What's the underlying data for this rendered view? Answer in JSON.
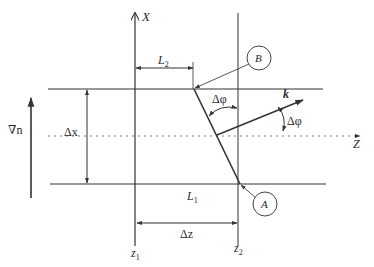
{
  "diagram": {
    "axes": {
      "x_label": "X",
      "z_label": "Z"
    },
    "planes": {
      "z1_label": "z",
      "z1_sub": "1",
      "z2_label": "z",
      "z2_sub": "2"
    },
    "dimensions": {
      "L2_label": "L",
      "L2_sub": "2",
      "L1_label": "L",
      "L1_sub": "1",
      "dz_label": "Δz",
      "dx_label": "Δx"
    },
    "gradient": {
      "label": "∇n"
    },
    "wave_vector": {
      "label": "k"
    },
    "angles": {
      "upper_label": "Δφ",
      "right_label": "Δφ"
    },
    "points": {
      "A_label": "A",
      "B_label": "B"
    },
    "colors": {
      "line": "#333333",
      "dotted": "#777777",
      "background": "#ffffff"
    }
  }
}
